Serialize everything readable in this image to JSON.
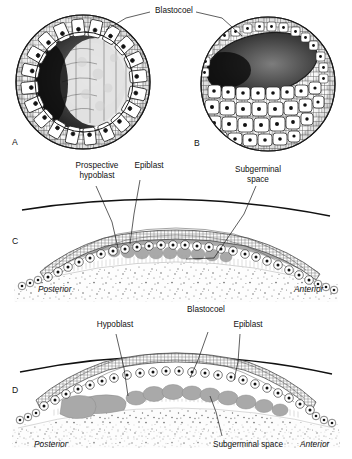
{
  "figure": {
    "title_visible": false,
    "domain": "embryology-diagram",
    "panels": [
      {
        "id": "A",
        "letter": "A",
        "type": "whole-mount-sphere-cutaway",
        "description": "Sectioned blastula sphere showing ring of columnar cells surrounding dark blastocoel cavity"
      },
      {
        "id": "B",
        "letter": "B",
        "type": "whole-mount-sphere-cutaway",
        "description": "Sectioned blastula with shallower dark blastocoel and broad field of polygonal surface cells"
      },
      {
        "id": "C",
        "letter": "C",
        "type": "sagittal-section",
        "description": "Blastoderm section, prospective hypoblast still within epiblast, subgerminal space below"
      },
      {
        "id": "D",
        "letter": "D",
        "type": "sagittal-section",
        "description": "Blastoderm section, hypoblast delaminated as discrete islands beneath epiblast, blastocoel between layers"
      }
    ]
  },
  "labels": {
    "blastocoel_top": "Blastocoel",
    "prospective_hypoblast": "Prospective\nhypoblast",
    "epiblast_c": "Epiblast",
    "subgerminal_space_c": "Subgerminal\nspace",
    "hypoblast_d": "Hypoblast",
    "blastocoel_d": "Blastocoel",
    "epiblast_d": "Epiblast",
    "subgerminal_space_d": "Subgerminal space",
    "posterior_c": "Posterior",
    "anterior_c": "Anterior",
    "posterior_d": "Posterior",
    "anterior_d": "Anterior",
    "letter_a": "A",
    "letter_b": "B",
    "letter_c": "C",
    "letter_d": "D"
  },
  "colors": {
    "ink": "#111111",
    "line": "#1a1a1a",
    "cell_outline": "#333333",
    "nucleus": "#111111",
    "cavity_dark": "#2b2b2b",
    "hypoblast_gray": "#a9a9a9",
    "hypoblast_gray_dark": "#8e8e8e",
    "yolk_stipple": "#6e6e6e",
    "background": "#ffffff"
  }
}
